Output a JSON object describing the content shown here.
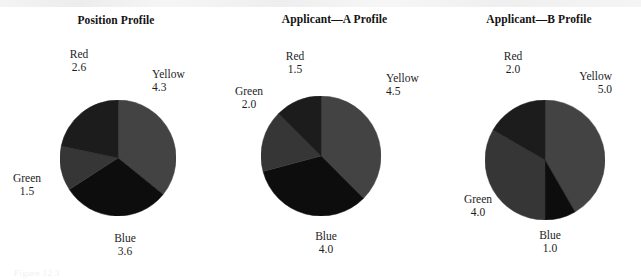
{
  "figure": {
    "background": "#ffffff",
    "ghost_caption": "Figure 12.3"
  },
  "palette": {
    "Yellow": "#434343",
    "Blue": "#0d0d0d",
    "Green": "#363636",
    "Red": "#1c1c1c"
  },
  "chart_data": [
    {
      "type": "pie",
      "title": "Position Profile",
      "categories": [
        "Yellow",
        "Blue",
        "Green",
        "Red"
      ],
      "values": [
        4.3,
        3.6,
        1.5,
        2.6
      ],
      "total": 12.0,
      "start_angle": 0,
      "direction": "clockwise",
      "labels": [
        {
          "name": "Yellow",
          "value": "4.3"
        },
        {
          "name": "Blue",
          "value": "3.6"
        },
        {
          "name": "Green",
          "value": "1.5"
        },
        {
          "name": "Red",
          "value": "2.6"
        }
      ]
    },
    {
      "type": "pie",
      "title": "Applicant—A Profile",
      "categories": [
        "Yellow",
        "Blue",
        "Green",
        "Red"
      ],
      "values": [
        4.5,
        4.0,
        2.0,
        1.5
      ],
      "total": 12.0,
      "start_angle": 0,
      "direction": "clockwise",
      "labels": [
        {
          "name": "Yellow",
          "value": "4.5"
        },
        {
          "name": "Blue",
          "value": "4.0"
        },
        {
          "name": "Green",
          "value": "2.0"
        },
        {
          "name": "Red",
          "value": "1.5"
        }
      ]
    },
    {
      "type": "pie",
      "title": "Applicant—B Profile",
      "categories": [
        "Yellow",
        "Blue",
        "Green",
        "Red"
      ],
      "values": [
        5.0,
        1.0,
        4.0,
        2.0
      ],
      "total": 12.0,
      "start_angle": 0,
      "direction": "clockwise",
      "labels": [
        {
          "name": "Yellow",
          "value": "5.0"
        },
        {
          "name": "Blue",
          "value": "1.0"
        },
        {
          "name": "Green",
          "value": "4.0"
        },
        {
          "name": "Red",
          "value": "2.0"
        }
      ]
    }
  ],
  "panels": [
    {
      "title_top": 14,
      "left": 0,
      "width": 232,
      "cx": 118,
      "cy": 158,
      "r": 58,
      "label_pos": {
        "Yellow": {
          "left": 152,
          "top": 68,
          "align": "l"
        },
        "Blue": {
          "left": 102,
          "top": 232,
          "align": "c"
        },
        "Green": {
          "left": 4,
          "top": 172,
          "align": "c"
        },
        "Red": {
          "left": 56,
          "top": 48,
          "align": "c"
        }
      }
    },
    {
      "title_top": 13,
      "left": 232,
      "width": 205,
      "cx": 321,
      "cy": 156,
      "r": 60,
      "label_pos": {
        "Yellow": {
          "left": 386,
          "top": 72,
          "align": "l"
        },
        "Blue": {
          "left": 303,
          "top": 230,
          "align": "c"
        },
        "Green": {
          "left": 226,
          "top": 85,
          "align": "c"
        },
        "Red": {
          "left": 272,
          "top": 50,
          "align": "c"
        }
      }
    },
    {
      "title_top": 13,
      "left": 437,
      "width": 204,
      "cx": 545,
      "cy": 160,
      "r": 60,
      "label_pos": {
        "Yellow": {
          "left": 612,
          "top": 70,
          "align": "r"
        },
        "Blue": {
          "left": 527,
          "top": 229,
          "align": "c"
        },
        "Green": {
          "left": 455,
          "top": 193,
          "align": "c"
        },
        "Red": {
          "left": 490,
          "top": 50,
          "align": "c"
        }
      }
    }
  ]
}
